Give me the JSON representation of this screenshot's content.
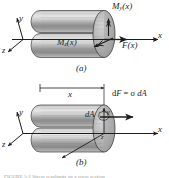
{
  "figure": {
    "type": "engineering-mechanics-diagram",
    "background_color": "#ffffff",
    "ink_color": "#1c1c1c",
    "body_fill_light": "#d8d8d8",
    "body_fill_dark": "#8f8f8f",
    "endcap_fill": "#b5b5b5"
  },
  "panel_a": {
    "caption": "(a)",
    "axes": {
      "y_label": "y",
      "z_label": "z",
      "x_label": "x"
    },
    "labels": {
      "moment_y": "M",
      "moment_y_sub": "y",
      "moment_y_arg": "(x)",
      "moment_z": "M",
      "moment_z_sub": "z",
      "moment_z_arg": "(x)",
      "force": "F",
      "force_arg": "(x)"
    }
  },
  "panel_b": {
    "caption": "(b)",
    "axes": {
      "y_label": "y",
      "z_label": "z",
      "x_label": "x"
    },
    "dimension": {
      "label": "x"
    },
    "labels": {
      "area_element": "dA",
      "force_element_d": "d",
      "force_element_F": "F",
      "force_element_eq": " = ",
      "force_element_sigma": "σ",
      "force_element_dA": " dA"
    }
  },
  "footer": {
    "cut_text": "FIGURE 5-2  Stress resultants on a cross section"
  }
}
